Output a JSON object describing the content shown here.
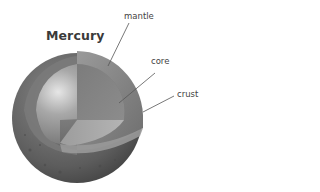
{
  "diagram": {
    "title": "Mercury",
    "labels": {
      "mantle": "mantle",
      "core": "core",
      "crust": "crust"
    },
    "colors": {
      "crust": "#6b6b6b",
      "mantle": "#8e8e8e",
      "core": "#9a9a9a",
      "leader_line": "#555555"
    }
  }
}
